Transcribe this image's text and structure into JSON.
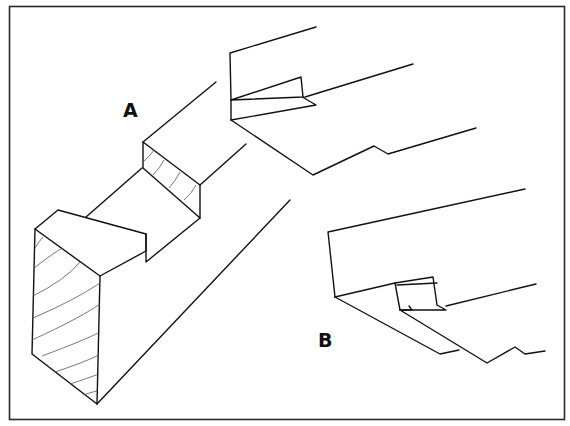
{
  "figure": {
    "type": "technical line drawing",
    "labels": {
      "a": "A",
      "b": "B"
    },
    "colors": {
      "background": "#ffffff",
      "line": "#111111",
      "grain": "#555555",
      "frame": "#2a2a2a"
    }
  }
}
